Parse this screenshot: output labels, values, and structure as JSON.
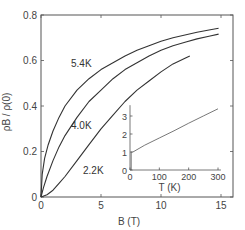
{
  "chart_data": [
    {
      "id": "main",
      "type": "line",
      "title": "",
      "xlabel": "B  (T)",
      "ylabel": "ρB / ρ(0)",
      "xlim": [
        0,
        16
      ],
      "ylim": [
        0,
        0.8
      ],
      "xticks": [
        0,
        5,
        10,
        15
      ],
      "xtick_labels": [
        "0",
        "5",
        "10",
        "15"
      ],
      "yticks": [
        0,
        0.2,
        0.4,
        0.6,
        0.8
      ],
      "ytick_labels": [
        "0",
        "0.2",
        "0.4",
        "0.6",
        "0.8"
      ],
      "grid": false,
      "legend": "none (curves labeled inline)",
      "series": [
        {
          "name": "5.4K",
          "label_pos": [
            2.5,
            0.57
          ],
          "x": [
            0,
            0.1,
            0.3,
            0.6,
            1,
            1.5,
            2,
            3,
            4,
            5,
            6,
            7,
            8,
            9,
            10,
            11,
            12,
            13,
            14,
            14.8
          ],
          "y": [
            0,
            0.1,
            0.17,
            0.23,
            0.29,
            0.35,
            0.4,
            0.47,
            0.52,
            0.56,
            0.59,
            0.62,
            0.645,
            0.665,
            0.685,
            0.7,
            0.712,
            0.724,
            0.734,
            0.742
          ]
        },
        {
          "name": "4.0K",
          "label_pos": [
            2.5,
            0.3
          ],
          "x": [
            0,
            0.2,
            0.5,
            1,
            1.5,
            2,
            3,
            4,
            5,
            6,
            7,
            8,
            9,
            10,
            11,
            12,
            13,
            14,
            14.8
          ],
          "y": [
            0,
            0.04,
            0.09,
            0.16,
            0.22,
            0.27,
            0.35,
            0.42,
            0.47,
            0.52,
            0.56,
            0.59,
            0.62,
            0.645,
            0.665,
            0.68,
            0.695,
            0.707,
            0.716
          ]
        },
        {
          "name": "2.2K",
          "label_pos": [
            3.5,
            0.1
          ],
          "x": [
            0,
            0.5,
            1,
            1.5,
            2,
            3,
            4,
            5,
            6,
            7,
            8,
            9,
            10,
            11,
            12,
            12.4
          ],
          "y": [
            0,
            0.01,
            0.03,
            0.06,
            0.09,
            0.16,
            0.23,
            0.3,
            0.36,
            0.42,
            0.47,
            0.51,
            0.55,
            0.585,
            0.61,
            0.62
          ]
        }
      ]
    },
    {
      "id": "inset",
      "type": "line",
      "title": "",
      "xlabel": "T  (K)",
      "ylabel": "",
      "xlim": [
        0,
        310
      ],
      "ylim": [
        0,
        3.6
      ],
      "xticks": [
        0,
        100,
        200,
        300
      ],
      "xtick_labels": [
        "0",
        "100",
        "200",
        "300"
      ],
      "yticks": [
        0,
        1,
        2,
        3
      ],
      "ytick_labels": [
        "0",
        "1",
        "2",
        "3"
      ],
      "grid": false,
      "series": [
        {
          "name": "ρ(T)",
          "x": [
            4,
            4,
            6,
            10,
            50,
            100,
            150,
            200,
            250,
            300
          ],
          "y": [
            0,
            1.0,
            1.0,
            1.0,
            1.38,
            1.78,
            2.18,
            2.6,
            3.0,
            3.4
          ]
        }
      ]
    }
  ],
  "colors": {
    "axis": "#555555",
    "curve": "#333333",
    "inset_curve": "#555555",
    "text": "#444444"
  }
}
